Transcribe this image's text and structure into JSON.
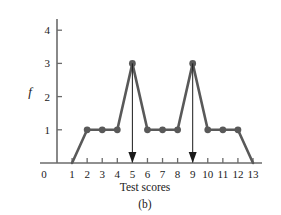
{
  "chart_data": {
    "type": "line",
    "title": "",
    "subtitle": "",
    "xlabel": "Test scores",
    "ylabel": "f",
    "caption": "(b)",
    "x": [
      1,
      2,
      3,
      4,
      5,
      6,
      7,
      8,
      9,
      10,
      11,
      12,
      13
    ],
    "values": [
      0,
      1,
      1,
      1,
      3,
      1,
      1,
      1,
      3,
      1,
      1,
      1,
      0
    ],
    "series": [
      {
        "name": "Frequency polygon",
        "x": [
          1,
          2,
          3,
          4,
          5,
          6,
          7,
          8,
          9,
          10,
          11,
          12,
          13
        ],
        "values": [
          0,
          1,
          1,
          1,
          3,
          1,
          1,
          1,
          3,
          1,
          1,
          1,
          0
        ]
      }
    ],
    "markers_at_x": [
      2,
      3,
      4,
      5,
      6,
      7,
      8,
      9,
      10,
      11,
      12
    ],
    "xlim": [
      0,
      13
    ],
    "ylim": [
      0,
      4.6
    ],
    "xticks": [
      0,
      1,
      2,
      3,
      4,
      5,
      6,
      7,
      8,
      9,
      10,
      11,
      12,
      13
    ],
    "xtick_labels": [
      "0",
      "1",
      "2",
      "3",
      "4",
      "5",
      "6",
      "7",
      "8",
      "9",
      "10",
      "11",
      "12",
      "13"
    ],
    "yticks": [
      1,
      2,
      3,
      4
    ],
    "ytick_labels": [
      "1",
      "2",
      "3",
      "4"
    ],
    "y_origin_label": "0",
    "grid": false,
    "legend": "none",
    "annotations": [
      {
        "type": "arrow",
        "label": "",
        "x": 5,
        "y_from": 3,
        "y_to": 0,
        "direction": "down"
      },
      {
        "type": "arrow",
        "label": "",
        "x": 9,
        "y_from": 3,
        "y_to": 0,
        "direction": "down"
      }
    ],
    "colors": {
      "series_line": "#595959",
      "marker": "#595959",
      "axis": "#6b6b6b",
      "annotation_arrow": "#1a1a1a",
      "text": "#1a1a1a",
      "background": "#ffffff"
    }
  }
}
